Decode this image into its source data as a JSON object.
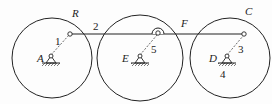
{
  "diagram": {
    "type": "linkage-mechanism",
    "labels": {
      "R": "R",
      "A": "A",
      "E": "E",
      "F": "F",
      "C": "C",
      "D": "D"
    },
    "link_numbers": {
      "l1": "1",
      "l2": "2",
      "l3": "3",
      "l4": "4",
      "l5": "5"
    },
    "colors": {
      "stroke": "#222222",
      "background": "#fdfdfd"
    }
  }
}
